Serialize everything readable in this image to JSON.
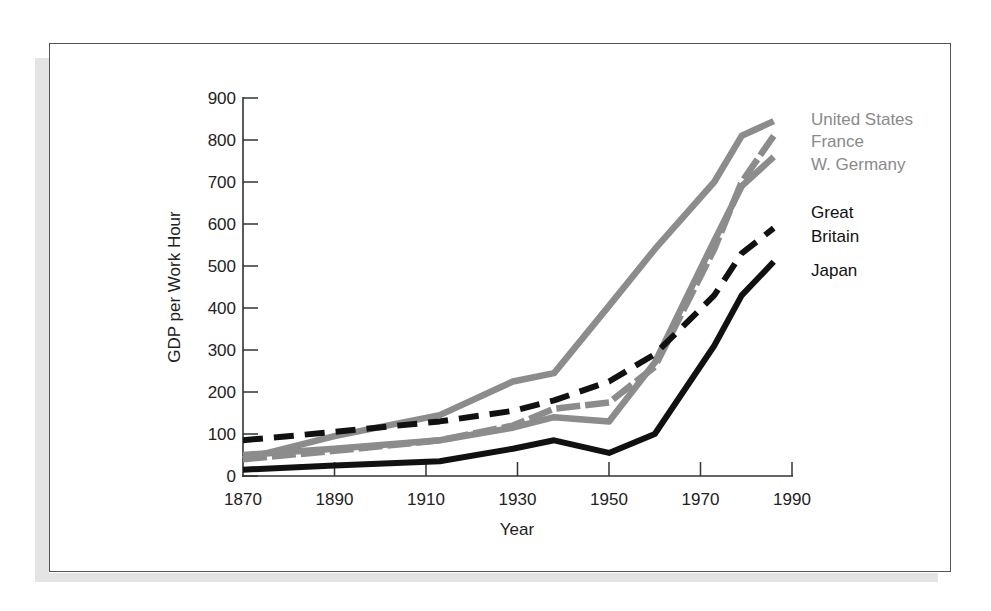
{
  "chart_data": {
    "type": "line",
    "title": "",
    "xlabel": "Year",
    "ylabel": "GDP per Work Hour",
    "xlim": [
      1870,
      1990
    ],
    "ylim": [
      0,
      900
    ],
    "x_ticks": [
      1870,
      1890,
      1910,
      1930,
      1950,
      1970,
      1990
    ],
    "y_ticks": [
      0,
      100,
      200,
      300,
      400,
      500,
      600,
      700,
      800,
      900
    ],
    "grid": false,
    "legend_position": "right, inline labels at line ends",
    "x": [
      1870,
      1890,
      1913,
      1929,
      1938,
      1950,
      1960,
      1973,
      1979,
      1986
    ],
    "series": [
      {
        "name": "United States",
        "style": "solid",
        "color": "#8c8c8c",
        "values": [
          40,
          95,
          145,
          225,
          245,
          405,
          540,
          700,
          810,
          845
        ]
      },
      {
        "name": "France",
        "style": "dashed",
        "color": "#8c8c8c",
        "values": [
          40,
          60,
          85,
          120,
          160,
          175,
          260,
          540,
          700,
          810
        ]
      },
      {
        "name": "W. Germany",
        "style": "solid",
        "color": "#8c8c8c",
        "values": [
          50,
          65,
          85,
          115,
          140,
          130,
          270,
          560,
          690,
          760
        ]
      },
      {
        "name": "Great Britain",
        "style": "dashed",
        "color": "#111111",
        "values": [
          85,
          105,
          130,
          155,
          180,
          225,
          290,
          430,
          530,
          590
        ]
      },
      {
        "name": "Japan",
        "style": "solid",
        "color": "#111111",
        "values": [
          15,
          25,
          35,
          65,
          85,
          55,
          100,
          310,
          430,
          510
        ]
      }
    ]
  },
  "legend": {
    "us": "United States",
    "france": "France",
    "germany": "W. Germany",
    "gb_line1": "Great",
    "gb_line2": "Britain",
    "japan": "Japan"
  },
  "axes": {
    "xlabel": "Year",
    "ylabel": "GDP per Work Hour",
    "x_tick_labels": [
      "1870",
      "1890",
      "1910",
      "1930",
      "1950",
      "1970",
      "1990"
    ],
    "y_tick_labels": [
      "0",
      "100",
      "200",
      "300",
      "400",
      "500",
      "600",
      "700",
      "800",
      "900"
    ]
  }
}
